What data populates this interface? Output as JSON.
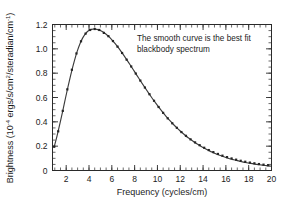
{
  "figure": {
    "background_color": "#ffffff",
    "ink_color": "#2a2a2a"
  },
  "annotation": {
    "line1": "The smooth curve is the best fit",
    "line2": "blackbody spectrum"
  },
  "axes": {
    "x_title_main": "Frequency (cycles/cm)",
    "y_title_prefix": "Brightness (10",
    "y_title_exp1": "-4",
    "y_title_mid": " ergs/s/cm",
    "y_title_exp2": "2",
    "y_title_mid2": "/steradian/cm",
    "y_title_exp3": "-1",
    "y_title_suffix": ")"
  },
  "chart_data": {
    "type": "line",
    "title": "",
    "subtitle": "",
    "xlabel": "Frequency (cycles/cm)",
    "ylabel": "Brightness (10^-4 ergs/s/cm^2/steradian/cm^-1)",
    "xlim": [
      0.8,
      20.0
    ],
    "ylim": [
      0.0,
      1.2
    ],
    "grid": false,
    "legend_position": "none",
    "xticks": [
      2,
      4,
      6,
      8,
      10,
      12,
      14,
      16,
      18,
      20
    ],
    "xtick_labels": [
      "2",
      "4",
      "6",
      "8",
      "10",
      "12",
      "14",
      "16",
      "18",
      "20"
    ],
    "x_minor_tick_interval": 0.5,
    "yticks": [
      0,
      0.2,
      0.4,
      0.6,
      0.8,
      1.0,
      1.2
    ],
    "ytick_labels": [
      "0",
      "0.2",
      "0.4",
      "0.6",
      "0.8",
      "1.0",
      "1.2"
    ],
    "y_minor_tick_interval": 0.05,
    "annotations": [
      {
        "text": "The smooth curve is the best fit blackbody spectrum",
        "x": 9.5,
        "y": 1.02
      }
    ],
    "series": [
      {
        "name": "best fit blackbody spectrum",
        "type": "line",
        "color": "#3b3b3b",
        "x": [
          0.95,
          1.2,
          1.45,
          1.7,
          1.95,
          2.2,
          2.45,
          2.7,
          2.95,
          3.2,
          3.45,
          3.7,
          3.95,
          4.2,
          4.45,
          4.7,
          4.95,
          5.2,
          5.45,
          5.7,
          5.95,
          6.2,
          6.45,
          6.7,
          6.95,
          7.2,
          7.45,
          7.7,
          7.95,
          8.2,
          8.45,
          8.7,
          8.95,
          9.2,
          9.45,
          9.7,
          9.95,
          10.2,
          10.45,
          10.7,
          10.95,
          11.2,
          11.45,
          11.7,
          11.95,
          12.2,
          12.45,
          12.7,
          12.95,
          13.2,
          13.45,
          13.7,
          13.95,
          14.2,
          14.45,
          14.7,
          14.95,
          15.2,
          15.45,
          15.7,
          15.95,
          16.2,
          16.45,
          16.7,
          16.95,
          17.2,
          17.45,
          17.7,
          17.95,
          18.2,
          18.45,
          18.7,
          18.95,
          19.2,
          19.45,
          19.7,
          19.95
        ],
        "y": [
          0.195,
          0.285,
          0.385,
          0.49,
          0.6,
          0.705,
          0.805,
          0.895,
          0.975,
          1.04,
          1.09,
          1.125,
          1.148,
          1.16,
          1.163,
          1.16,
          1.152,
          1.14,
          1.124,
          1.104,
          1.08,
          1.053,
          1.024,
          0.993,
          0.96,
          0.926,
          0.891,
          0.855,
          0.819,
          0.782,
          0.746,
          0.71,
          0.675,
          0.64,
          0.606,
          0.573,
          0.541,
          0.51,
          0.48,
          0.452,
          0.425,
          0.399,
          0.374,
          0.351,
          0.329,
          0.308,
          0.288,
          0.269,
          0.252,
          0.235,
          0.22,
          0.205,
          0.191,
          0.178,
          0.166,
          0.155,
          0.144,
          0.134,
          0.125,
          0.117,
          0.109,
          0.101,
          0.094,
          0.088,
          0.082,
          0.076,
          0.071,
          0.066,
          0.062,
          0.058,
          0.054,
          0.05,
          0.047,
          0.044,
          0.041,
          0.038,
          0.036
        ]
      },
      {
        "name": "FIRAS measurements",
        "type": "scatter",
        "marker": "square",
        "color": "#242424",
        "x": [
          0.95,
          1.3,
          1.7,
          2.1,
          2.5,
          2.9,
          3.3,
          3.7,
          4.1,
          4.5,
          4.9,
          5.3,
          5.7,
          6.1,
          6.5,
          6.9,
          7.3,
          7.7,
          8.1,
          8.5,
          8.9,
          9.3,
          9.7,
          10.1,
          10.5,
          10.9,
          11.3,
          11.7,
          12.1,
          12.5,
          12.9,
          13.3,
          13.7,
          14.1,
          14.5,
          14.9,
          15.3,
          15.7,
          16.1,
          16.5,
          16.9,
          17.3,
          17.7,
          18.1,
          18.5,
          18.9,
          19.3,
          19.7
        ],
        "y": [
          0.195,
          0.322,
          0.49,
          0.667,
          0.828,
          0.962,
          1.062,
          1.125,
          1.155,
          1.163,
          1.155,
          1.131,
          1.104,
          1.064,
          1.018,
          0.966,
          0.911,
          0.855,
          0.797,
          0.739,
          0.682,
          0.627,
          0.573,
          0.522,
          0.474,
          0.429,
          0.388,
          0.351,
          0.316,
          0.285,
          0.256,
          0.231,
          0.208,
          0.187,
          0.168,
          0.151,
          0.136,
          0.122,
          0.11,
          0.099,
          0.089,
          0.08,
          0.072,
          0.065,
          0.059,
          0.053,
          0.048,
          0.044
        ]
      }
    ]
  }
}
